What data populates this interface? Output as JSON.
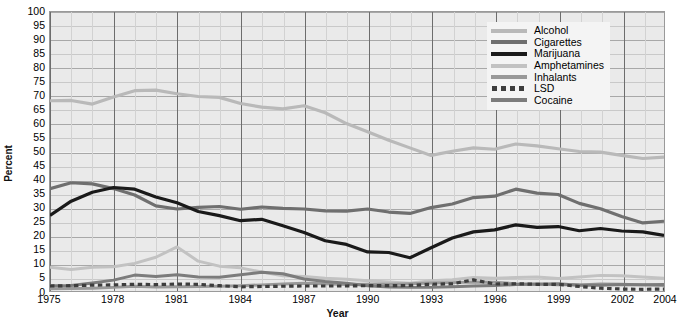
{
  "chart_data": {
    "type": "line",
    "title": "",
    "xlabel": "Year",
    "ylabel": "Percent",
    "xlim": [
      1975,
      2004
    ],
    "ylim": [
      0,
      100
    ],
    "ytick_step": 5,
    "yticks": [
      100,
      95,
      90,
      85,
      80,
      75,
      70,
      65,
      60,
      55,
      50,
      45,
      40,
      35,
      30,
      25,
      20,
      15,
      10,
      5,
      0
    ],
    "xticks": [
      1975,
      1978,
      1981,
      1984,
      1987,
      1990,
      1993,
      1996,
      1999,
      2002,
      2004
    ],
    "x": [
      1975,
      1976,
      1977,
      1978,
      1979,
      1980,
      1981,
      1982,
      1983,
      1984,
      1985,
      1986,
      1987,
      1988,
      1989,
      1990,
      1991,
      1992,
      1993,
      1994,
      1995,
      1996,
      1997,
      1998,
      1999,
      2000,
      2001,
      2002,
      2003,
      2004
    ],
    "grid": true,
    "legend_position": "top-right",
    "series": [
      {
        "name": "Alcohol",
        "color": "#b9b9b9",
        "style": "solid",
        "width": 3.2,
        "values": [
          68.2,
          68.3,
          67.0,
          69.5,
          71.8,
          72.0,
          70.7,
          69.7,
          69.4,
          67.2,
          65.9,
          65.3,
          66.4,
          63.9,
          60.0,
          57.1,
          54.0,
          51.3,
          48.6,
          50.1,
          51.3,
          50.8,
          52.7,
          52.0,
          51.0,
          50.0,
          49.8,
          48.6,
          47.5,
          48.0
        ]
      },
      {
        "name": "Cigarettes",
        "color": "#6f6f6f",
        "style": "solid",
        "width": 3.2,
        "values": [
          36.7,
          38.8,
          38.4,
          36.7,
          34.4,
          30.5,
          29.4,
          30.0,
          30.3,
          29.3,
          30.1,
          29.6,
          29.4,
          28.7,
          28.6,
          29.4,
          28.3,
          27.8,
          29.9,
          31.2,
          33.5,
          34.0,
          36.5,
          35.1,
          34.6,
          31.4,
          29.5,
          26.7,
          24.4,
          25.0
        ]
      },
      {
        "name": "Marijuana",
        "color": "#1a1a1a",
        "style": "solid",
        "width": 3.2,
        "values": [
          27.1,
          32.2,
          35.4,
          37.1,
          36.5,
          33.7,
          31.6,
          28.5,
          27.0,
          25.2,
          25.7,
          23.4,
          21.0,
          18.0,
          16.7,
          14.0,
          13.8,
          11.9,
          15.5,
          19.0,
          21.2,
          21.9,
          23.7,
          22.8,
          23.1,
          21.6,
          22.4,
          21.5,
          21.2,
          19.9
        ]
      },
      {
        "name": "Amphetamines",
        "color": "#c2c2c2",
        "style": "solid",
        "width": 3.0,
        "values": [
          8.5,
          7.7,
          8.5,
          8.7,
          9.9,
          12.1,
          15.8,
          10.7,
          8.9,
          8.3,
          6.8,
          5.5,
          5.2,
          4.6,
          4.2,
          3.7,
          3.2,
          2.8,
          3.7,
          4.0,
          4.8,
          4.6,
          4.8,
          5.0,
          4.5,
          5.0,
          5.6,
          5.5,
          5.0,
          4.6
        ]
      },
      {
        "name": "Inhalants",
        "color": "#999999",
        "style": "solid",
        "width": 3.0,
        "values": [
          0.8,
          0.9,
          1.0,
          1.3,
          1.7,
          1.4,
          1.5,
          1.6,
          1.7,
          1.9,
          2.2,
          2.5,
          2.8,
          2.6,
          2.3,
          2.4,
          2.4,
          2.6,
          2.9,
          3.0,
          3.2,
          3.1,
          2.6,
          2.5,
          2.2,
          2.2,
          2.5,
          2.4,
          2.2,
          2.0
        ]
      },
      {
        "name": "LSD",
        "color": "#3d3d3d",
        "style": "dotted",
        "width": 3.2,
        "values": [
          1.8,
          1.9,
          2.1,
          2.2,
          2.4,
          2.3,
          2.5,
          2.4,
          1.9,
          1.5,
          1.6,
          1.7,
          1.8,
          1.8,
          1.8,
          1.9,
          1.9,
          2.0,
          2.4,
          2.6,
          4.0,
          2.5,
          2.6,
          2.4,
          2.4,
          1.6,
          1.0,
          0.7,
          0.6,
          0.7
        ]
      },
      {
        "name": "Cocaine",
        "color": "#7c7c7c",
        "style": "solid",
        "width": 3.0,
        "values": [
          1.9,
          2.0,
          2.9,
          3.9,
          5.7,
          5.2,
          5.8,
          5.0,
          4.9,
          5.8,
          6.7,
          6.2,
          4.3,
          3.4,
          2.8,
          1.9,
          1.4,
          1.3,
          1.3,
          1.5,
          1.8,
          2.0,
          2.3,
          2.4,
          2.6,
          2.1,
          2.1,
          2.3,
          2.2,
          2.3
        ]
      }
    ]
  },
  "legend": {
    "items": [
      {
        "label": "Alcohol"
      },
      {
        "label": "Cigarettes"
      },
      {
        "label": "Marijuana"
      },
      {
        "label": "Amphetamines"
      },
      {
        "label": "Inhalants"
      },
      {
        "label": "LSD"
      },
      {
        "label": "Cocaine"
      }
    ]
  },
  "axes": {
    "y_title": "Percent",
    "x_title": "Year"
  }
}
